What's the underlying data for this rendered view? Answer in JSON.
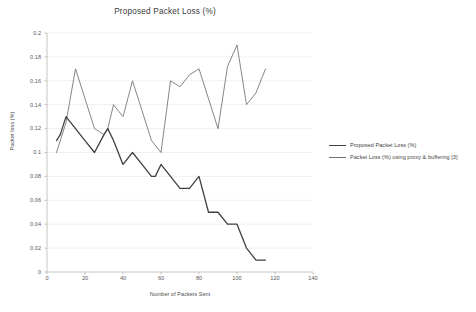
{
  "chart_data": {
    "type": "line",
    "title": "Proposed Packet Loss (%)",
    "xlabel": "Number of Packets Sent",
    "ylabel": "Packet loss (%)",
    "xlim": [
      0,
      140
    ],
    "ylim": [
      0,
      0.2
    ],
    "xticks": [
      "0",
      "20",
      "40",
      "60",
      "80",
      "100",
      "120",
      "140"
    ],
    "xtick_values": [
      0,
      20,
      40,
      60,
      80,
      100,
      120,
      140
    ],
    "yticks": [
      "0",
      "0.02",
      "0.04",
      "0.06",
      "0.08",
      "0.1",
      "0.12",
      "0.14",
      "0.16",
      "0.18",
      "0.2"
    ],
    "ytick_values": [
      0,
      0.02,
      0.04,
      0.06,
      0.08,
      0.1,
      0.12,
      0.14,
      0.16,
      0.18,
      0.2
    ],
    "grid": "horizontal",
    "legend_position": "right",
    "series": [
      {
        "name": "Proposed Packet Loss (%)",
        "color": "#404040",
        "x": [
          5,
          7,
          10,
          15,
          20,
          25,
          30,
          32,
          35,
          40,
          45,
          50,
          55,
          57,
          60,
          65,
          70,
          72,
          75,
          80,
          85,
          87,
          90,
          95,
          97,
          100,
          105,
          110,
          115
        ],
        "values": [
          0.11,
          0.115,
          0.13,
          0.12,
          0.11,
          0.1,
          0.115,
          0.12,
          0.11,
          0.09,
          0.1,
          0.09,
          0.08,
          0.08,
          0.09,
          0.08,
          0.07,
          0.07,
          0.07,
          0.08,
          0.05,
          0.05,
          0.05,
          0.04,
          0.04,
          0.04,
          0.02,
          0.01,
          0.01
        ]
      },
      {
        "name": "Packet Loss (%) using proxy & buffering [3]",
        "color": "#707070",
        "x": [
          5,
          10,
          15,
          20,
          25,
          30,
          32,
          35,
          40,
          45,
          50,
          55,
          60,
          65,
          70,
          75,
          80,
          85,
          90,
          95,
          100,
          105,
          110,
          115
        ],
        "values": [
          0.1,
          0.125,
          0.17,
          0.145,
          0.12,
          0.115,
          0.12,
          0.14,
          0.13,
          0.16,
          0.135,
          0.11,
          0.1,
          0.16,
          0.155,
          0.165,
          0.17,
          0.145,
          0.12,
          0.172,
          0.19,
          0.14,
          0.15,
          0.17
        ]
      }
    ]
  },
  "legend": {
    "entries": [
      {
        "label": "Proposed Packet Loss (%)",
        "color": "#404040"
      },
      {
        "label": "Packet Loss (%) using proxy & buffering [3]",
        "color": "#707070"
      }
    ]
  }
}
